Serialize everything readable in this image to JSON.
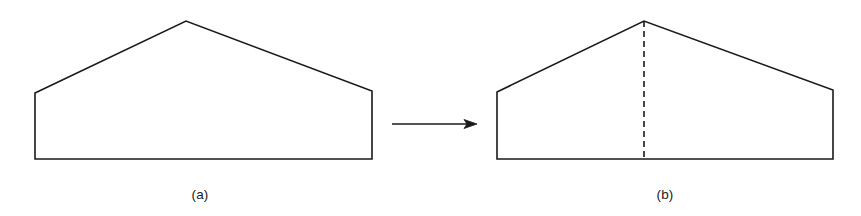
{
  "figure": {
    "background_color": "#ffffff",
    "stroke_color": "#1a1a1a",
    "stroke_width": 1.6,
    "captions": {
      "left_label": "(a)",
      "right_label": "(b)"
    },
    "panels": [
      {
        "id": "panel-a",
        "label": "(a)",
        "shape_name": "pentagon-house-outline",
        "fill": "none",
        "vertices": [
          [
            35,
            93
          ],
          [
            186,
            21
          ],
          [
            372,
            91
          ],
          [
            372,
            159
          ],
          [
            35,
            159
          ]
        ],
        "points_attr": "35,93 186,21 372,91 372,159 35,159",
        "has_dashed_divider": false
      },
      {
        "id": "panel-b",
        "label": "(b)",
        "shape_name": "pentagon-house-outline-with-split",
        "fill": "none",
        "vertices": [
          [
            497,
            92
          ],
          [
            644,
            21
          ],
          [
            833,
            90
          ],
          [
            833,
            159
          ],
          [
            497,
            159
          ]
        ],
        "points_attr": "497,92 644,21 833,90 833,159 497,159",
        "has_dashed_divider": true,
        "divider": {
          "name": "dashed-split-line",
          "x1": 644,
          "y1": 21,
          "x2": 644,
          "y2": 159,
          "dash_pattern": "6 4"
        }
      }
    ],
    "arrow": {
      "name": "transformation-arrow",
      "x1": 392,
      "y1": 124,
      "x2": 470,
      "y2": 124,
      "head_points": "477,124 464,119.5 467,124 464,128.5",
      "direction": "right"
    }
  }
}
